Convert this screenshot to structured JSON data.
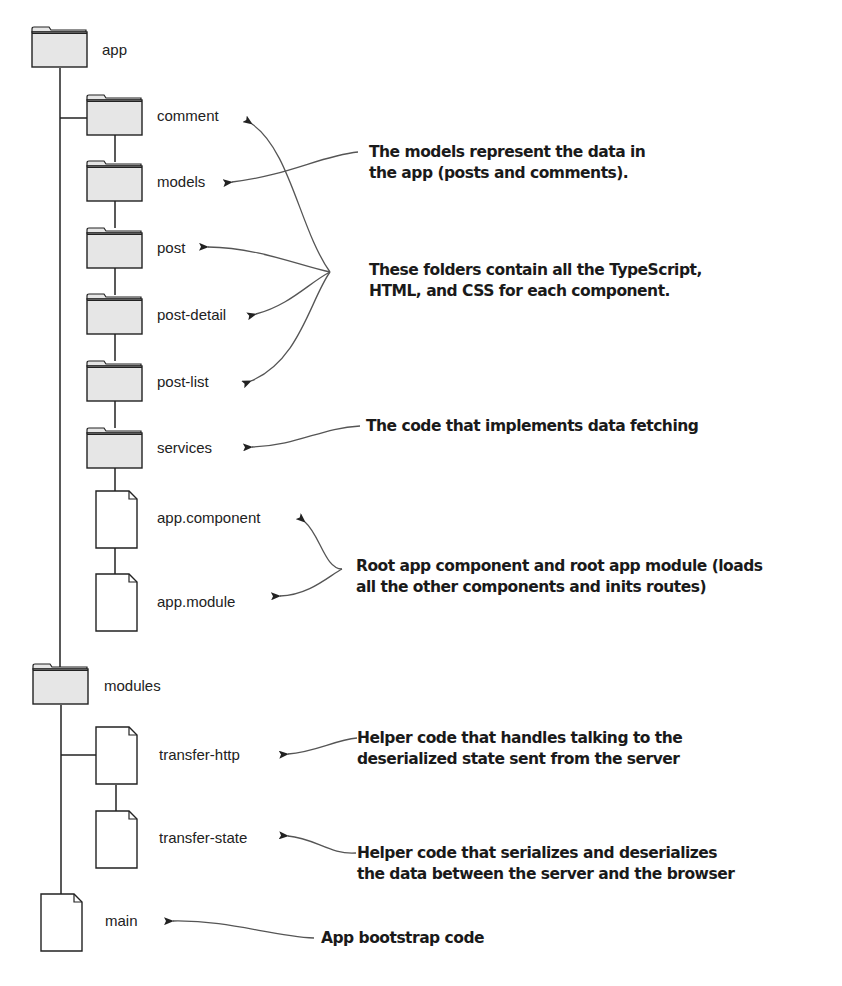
{
  "diagram": {
    "type": "file-tree-annotated",
    "colors": {
      "folder_fill": "#e6e6e6",
      "stroke": "#222222",
      "file_fill": "#ffffff",
      "text": "#1a1a1a",
      "arrow": "#555555"
    },
    "tree": [
      {
        "name": "app",
        "kind": "folder",
        "depth": 0
      },
      {
        "name": "comment",
        "kind": "folder",
        "depth": 1
      },
      {
        "name": "models",
        "kind": "folder",
        "depth": 1
      },
      {
        "name": "post",
        "kind": "folder",
        "depth": 1
      },
      {
        "name": "post-detail",
        "kind": "folder",
        "depth": 1
      },
      {
        "name": "post-list",
        "kind": "folder",
        "depth": 1
      },
      {
        "name": "services",
        "kind": "folder",
        "depth": 1
      },
      {
        "name": "app.component",
        "kind": "file",
        "depth": 1
      },
      {
        "name": "app.module",
        "kind": "file",
        "depth": 1
      },
      {
        "name": "modules",
        "kind": "folder",
        "depth": 0
      },
      {
        "name": "transfer-http",
        "kind": "file",
        "depth": 1
      },
      {
        "name": "transfer-state",
        "kind": "file",
        "depth": 1
      },
      {
        "name": "main",
        "kind": "file",
        "depth": 0
      }
    ],
    "callouts": [
      {
        "lines": [
          "The models represent the data in",
          "the app (posts and comments)."
        ],
        "targets": [
          "models"
        ]
      },
      {
        "lines": [
          "These folders contain all the TypeScript,",
          "HTML, and CSS for each component."
        ],
        "targets": [
          "comment",
          "post",
          "post-detail",
          "post-list"
        ]
      },
      {
        "lines": [
          "The code that implements data fetching"
        ],
        "targets": [
          "services"
        ]
      },
      {
        "lines": [
          "Root app component and root app module (loads",
          "all the other components and inits routes)"
        ],
        "targets": [
          "app.component",
          "app.module"
        ]
      },
      {
        "lines": [
          "Helper code that handles talking to the",
          "deserialized state sent from the server"
        ],
        "targets": [
          "transfer-http"
        ]
      },
      {
        "lines": [
          "Helper code that serializes and deserializes",
          "the data between the server and the browser"
        ],
        "targets": [
          "transfer-state"
        ]
      },
      {
        "lines": [
          "App bootstrap code"
        ],
        "targets": [
          "main"
        ]
      }
    ]
  }
}
